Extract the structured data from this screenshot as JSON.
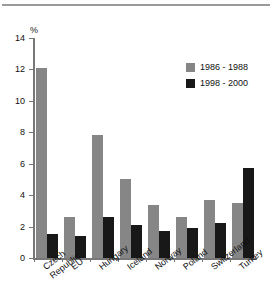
{
  "chart_data": {
    "type": "bar",
    "title": "",
    "xlabel": "",
    "ylabel": "%",
    "ylim": [
      0,
      14
    ],
    "yticks": [
      0,
      2,
      4,
      6,
      8,
      10,
      12,
      14
    ],
    "ytick_labels": [
      "0",
      "2",
      "4",
      "6",
      "8",
      "10",
      "12",
      "14"
    ],
    "grid": false,
    "legend_position": "top-right",
    "categories": [
      "Czech\nRepublic",
      "EU",
      "Hungary",
      "Iceland",
      "Norway",
      "Poland",
      "Switzerland",
      "Turkey"
    ],
    "series": [
      {
        "name": "1986 - 1988",
        "color": "#868686",
        "values": [
          12.1,
          2.6,
          7.8,
          5.0,
          3.4,
          2.6,
          3.7,
          3.5
        ]
      },
      {
        "name": "1998 - 2000",
        "color": "#181818",
        "values": [
          1.5,
          1.4,
          2.6,
          2.1,
          1.7,
          1.9,
          2.2,
          5.7
        ]
      }
    ]
  },
  "axis": {
    "unit_label": "%"
  }
}
